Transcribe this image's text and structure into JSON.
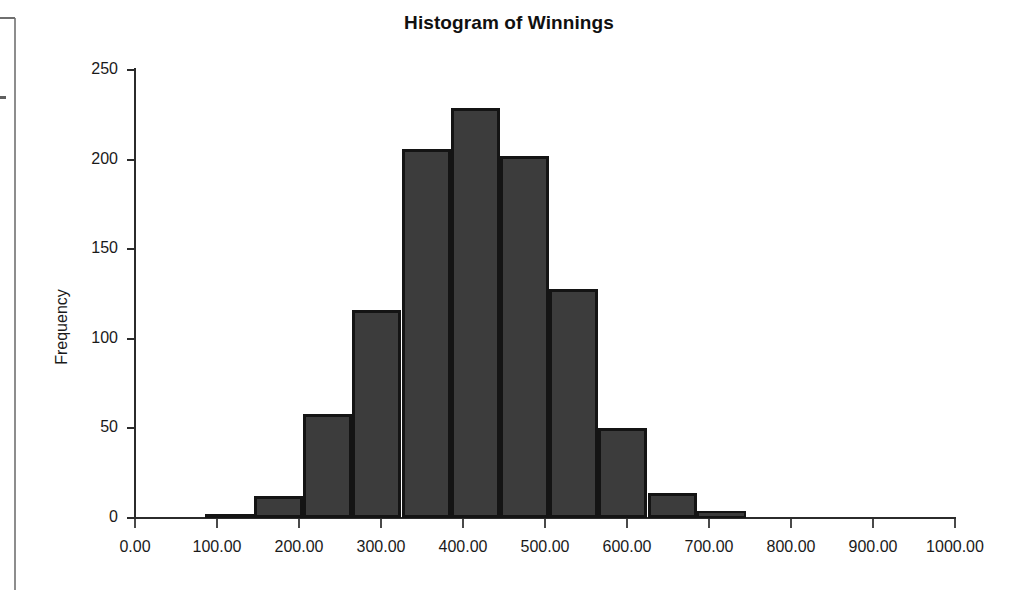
{
  "chart_data": {
    "type": "bar",
    "title": "Histogram of Winnings",
    "xlabel": "",
    "ylabel": "Frequency",
    "xlim": [
      0,
      1000
    ],
    "ylim": [
      0,
      250
    ],
    "grid": false,
    "legend": false,
    "bin_width": 60,
    "bin_edges": [
      85,
      145,
      205,
      265,
      325,
      385,
      445,
      505,
      565,
      625,
      685,
      745
    ],
    "categories": [
      "85-145",
      "145-205",
      "205-265",
      "265-325",
      "325-385",
      "385-445",
      "445-505",
      "505-565",
      "565-625",
      "625-685",
      "685-745"
    ],
    "values": [
      2,
      12,
      58,
      116,
      206,
      229,
      202,
      128,
      50,
      14,
      4
    ],
    "x_tick_labels": [
      "0.00",
      "100.00",
      "200.00",
      "300.00",
      "400.00",
      "500.00",
      "600.00",
      "700.00",
      "800.00",
      "900.00",
      "1000.00"
    ],
    "x_tick_values": [
      0,
      100,
      200,
      300,
      400,
      500,
      600,
      700,
      800,
      900,
      1000
    ],
    "y_tick_labels": [
      "0",
      "50",
      "100",
      "150",
      "200",
      "250"
    ],
    "y_tick_values": [
      0,
      50,
      100,
      150,
      200,
      250
    ],
    "bar_fill_color": "#3c3c3c",
    "bar_border_color": "#141414",
    "axis_color": "#2b2b2b",
    "background_color": "#ffffff"
  }
}
